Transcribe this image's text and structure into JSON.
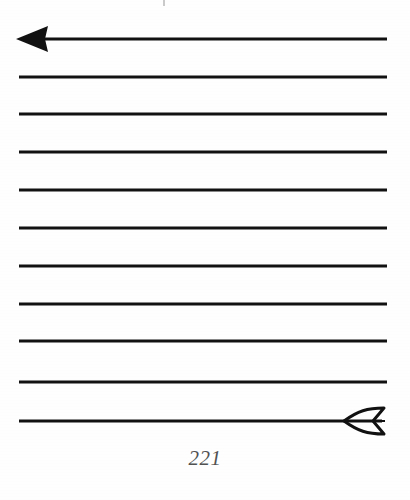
{
  "document": {
    "kind": "scanned-book-page-figure",
    "page_number": "221",
    "background_color": "#fefefe",
    "ink_color": "#111111"
  },
  "figure": {
    "name": "horizontal-ruled-lines-with-arrow",
    "line_count": 11,
    "line_color": "#111111",
    "line_thickness_px": 3,
    "line_x_start_px": 19,
    "line_x_end_px": 387,
    "line_y_positions_px": [
      39,
      77,
      114,
      152,
      190,
      228,
      266,
      304,
      341,
      382,
      421
    ],
    "arrowhead": {
      "name": "solid-left-arrowhead",
      "position": "left end of first line",
      "style": "filled",
      "tip_x_px": 16,
      "base_x_px": 48,
      "center_y_px": 39,
      "half_height_px": 13
    },
    "fletching": {
      "name": "outlined-arrow-fletching",
      "position": "right end of last line",
      "style": "outline",
      "x_start_px": 344,
      "x_end_px": 384,
      "center_y_px": 421,
      "half_height_px": 13,
      "stroke_width_px": 3
    }
  },
  "marks": {
    "top_speck": {
      "name": "scan-speck",
      "x_px": 163,
      "y_px": 0,
      "color": "#b8b8b8"
    }
  }
}
